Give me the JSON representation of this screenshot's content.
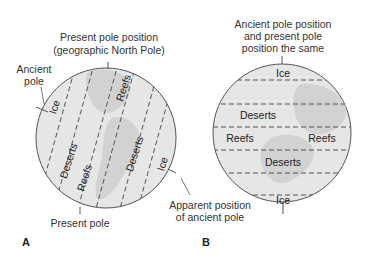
{
  "panel_a": {
    "letter": "A",
    "top_label_line1": "Present pole position",
    "top_label_line2": "(geographic North Pole)",
    "ancient_pole_line1": "Ancient",
    "ancient_pole_line2": "pole",
    "bottom_label": "Present pole",
    "apparent_line1": "Apparent position",
    "apparent_line2": "of ancient pole",
    "zones": [
      "Ice",
      "Deserts",
      "Reefs",
      "Reefs",
      "Deserts",
      "Ice"
    ]
  },
  "panel_b": {
    "letter": "B",
    "top_label_line1": "Ancient pole position",
    "top_label_line2": "and present pole",
    "top_label_line3": "position the same",
    "zones": [
      "Ice",
      "Deserts",
      "Reefs",
      "Reefs",
      "Deserts",
      "Ice"
    ]
  },
  "colors": {
    "globe_fill": "#e6e6e6",
    "land_fill": "#cfcfcf",
    "outline": "#555555",
    "dash": "#444444"
  }
}
